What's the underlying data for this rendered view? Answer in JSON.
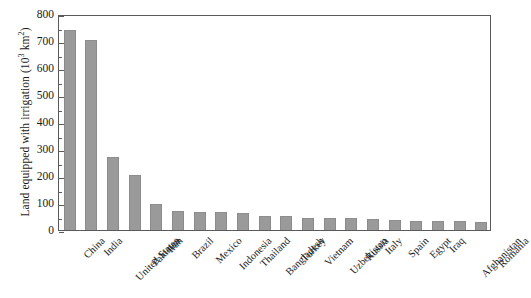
{
  "chart_data": {
    "type": "bar",
    "title": "",
    "subtitle": "",
    "xlabel": "",
    "ylabel": "Land equipped with irrigation (10³ km²)",
    "ylabel_base": "Land equipped with irrigation (10",
    "ylabel_exponent": "3",
    "ylabel_tail": " km",
    "ylabel_unit_exponent": "2",
    "ylabel_close": ")",
    "ylim": [
      0,
      800
    ],
    "ytick_step": 100,
    "yminor_step": 50,
    "grid": false,
    "legend": false,
    "legend_position": "none",
    "bar_color": "#9a9a9a",
    "frame_color": "#5a5a5a",
    "ytick_labels": [
      "0",
      "100",
      "200",
      "300",
      "400",
      "500",
      "600",
      "700",
      "800"
    ],
    "categories": [
      "China",
      "India",
      "United States",
      "Pakistan",
      "Iran",
      "Brazil",
      "Mexico",
      "Indonesia",
      "Thailand",
      "Bangladesh",
      "Turkey",
      "Vietnam",
      "Uzbekistan",
      "Russia",
      "Italy",
      "Spain",
      "Egypt",
      "Iraq",
      "Afghanistan",
      "Romania"
    ],
    "values": [
      742,
      705,
      270,
      202,
      95,
      70,
      68,
      67,
      64,
      52,
      51,
      46,
      44,
      43,
      40,
      38,
      35,
      34,
      32,
      30
    ]
  }
}
